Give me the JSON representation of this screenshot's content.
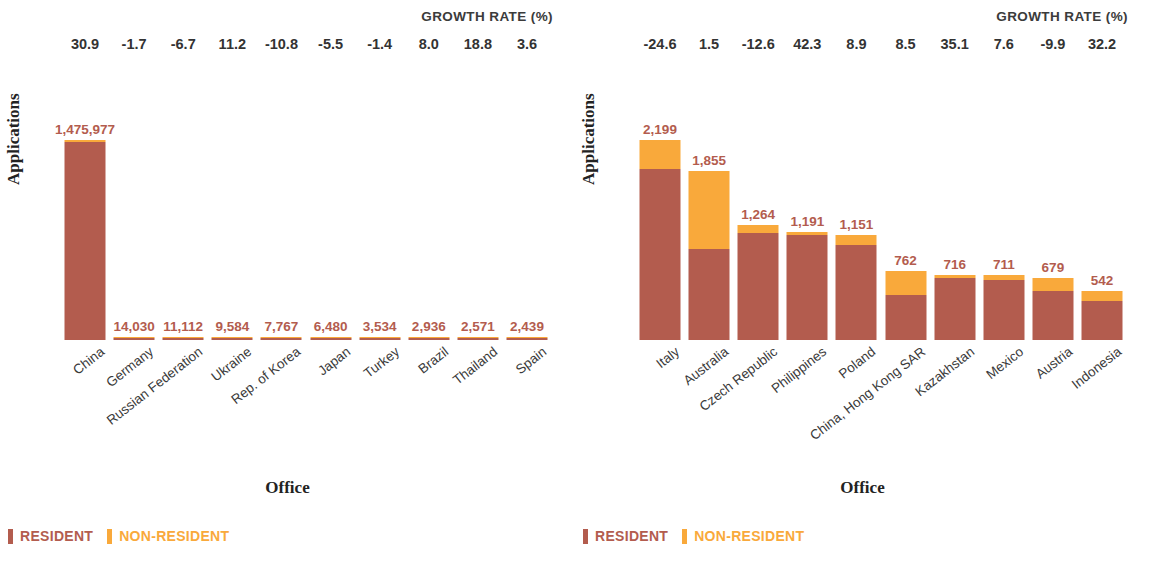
{
  "colors": {
    "resident": "#B35C4E",
    "non_resident": "#F9A93B",
    "text": "#333333",
    "axis_title": "#222222"
  },
  "growth_title": "GROWTH RATE (%)",
  "axis": {
    "y_title": "Applications",
    "x_title": "Office"
  },
  "legend": {
    "resident": "RESIDENT",
    "non_resident": "NON-RESIDENT"
  },
  "chart_data": [
    {
      "type": "bar",
      "id": "left",
      "title": "",
      "xlabel": "Office",
      "ylabel": "Applications",
      "annotation_header": "GROWTH RATE (%)",
      "stacked": true,
      "legend": [
        "RESIDENT",
        "NON-RESIDENT"
      ],
      "legend_position": "bottom-left",
      "grid": false,
      "ylim": [
        0,
        1475977
      ],
      "categories": [
        "China",
        "Germany",
        "Russian Federation",
        "Ukraine",
        "Rep. of Korea",
        "Japan",
        "Turkey",
        "Brazil",
        "Thailand",
        "Spain"
      ],
      "totals": [
        1475977,
        14030,
        11112,
        9584,
        7767,
        6480,
        3534,
        2936,
        2571,
        2439
      ],
      "total_labels": [
        "1,475,977",
        "14,030",
        "11,112",
        "9,584",
        "7,767",
        "6,480",
        "3,534",
        "2,936",
        "2,571",
        "2,439"
      ],
      "growth_rates": [
        "30.9",
        "-1.7",
        "-6.7",
        "11.2",
        "-10.8",
        "-5.5",
        "-1.4",
        "8.0",
        "18.8",
        "3.6"
      ],
      "series": [
        {
          "name": "RESIDENT",
          "values": [
            1463500,
            11250,
            10750,
            8500,
            7100,
            5650,
            3400,
            2800,
            2400,
            2250
          ]
        },
        {
          "name": "NON-RESIDENT",
          "values": [
            12477,
            2780,
            362,
            1084,
            667,
            830,
            134,
            136,
            171,
            189
          ]
        }
      ]
    },
    {
      "type": "bar",
      "id": "right",
      "title": "",
      "xlabel": "Office",
      "ylabel": "Applications",
      "annotation_header": "GROWTH RATE (%)",
      "stacked": true,
      "legend": [
        "RESIDENT",
        "NON-RESIDENT"
      ],
      "legend_position": "bottom-left",
      "grid": false,
      "ylim": [
        0,
        2199
      ],
      "categories": [
        "Italy",
        "Australia",
        "Czech Republic",
        "Philippines",
        "Poland",
        "China, Hong Kong SAR",
        "Kazakhstan",
        "Mexico",
        "Austria",
        "Indonesia"
      ],
      "totals": [
        2199,
        1855,
        1264,
        1191,
        1151,
        762,
        716,
        711,
        679,
        542
      ],
      "total_labels": [
        "2,199",
        "1,855",
        "1,264",
        "1,191",
        "1,151",
        "762",
        "716",
        "711",
        "679",
        "542"
      ],
      "growth_rates": [
        "-24.6",
        "1.5",
        "-12.6",
        "42.3",
        "8.9",
        "8.5",
        "35.1",
        "7.6",
        "-9.9",
        "32.2"
      ],
      "series": [
        {
          "name": "RESIDENT",
          "values": [
            1880,
            1000,
            1180,
            1150,
            1040,
            500,
            680,
            655,
            540,
            430
          ]
        },
        {
          "name": "NON-RESIDENT",
          "values": [
            319,
            855,
            84,
            41,
            111,
            262,
            36,
            56,
            139,
            112
          ]
        }
      ]
    }
  ]
}
